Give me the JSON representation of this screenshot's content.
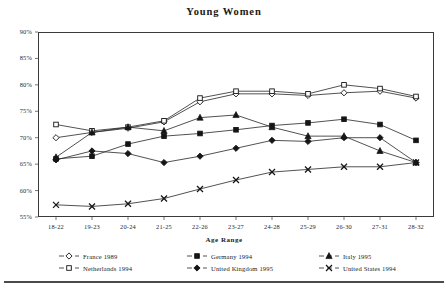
{
  "chart": {
    "title": "Young Women",
    "xlabel": "Age Range",
    "ylabel": ""
  },
  "chart_data": {
    "type": "line",
    "title": "Young Women",
    "xlabel": "Age Range",
    "ylabel": "",
    "ylim": [
      55,
      90
    ],
    "ytick_labels": [
      "90%",
      "85%",
      "80%",
      "75%",
      "70%",
      "65%",
      "60%",
      "55%"
    ],
    "yticks": [
      90,
      85,
      80,
      75,
      70,
      65,
      60,
      55
    ],
    "grid": false,
    "legend_position": "bottom",
    "categories": [
      "18-22",
      "19-23",
      "20-24",
      "21-25",
      "22-26",
      "23-27",
      "24-28",
      "25-29",
      "26-30",
      "27-31",
      "28-32"
    ],
    "series": [
      {
        "name": "France 1989",
        "marker": "open-diamond",
        "values": [
          70.0,
          71.0,
          71.8,
          73.0,
          76.8,
          78.3,
          78.3,
          78.0,
          78.5,
          78.8,
          77.5
        ]
      },
      {
        "name": "Netherlands 1994",
        "marker": "open-square",
        "values": [
          72.5,
          71.3,
          72.0,
          73.2,
          77.5,
          78.8,
          78.8,
          78.3,
          80.0,
          79.3,
          77.8
        ]
      },
      {
        "name": "Germany 1994",
        "marker": "filled-square",
        "values": [
          66.0,
          66.5,
          68.8,
          70.3,
          70.8,
          71.5,
          72.3,
          72.8,
          73.5,
          72.5,
          69.5
        ]
      },
      {
        "name": "United Kingdom 1995",
        "marker": "filled-diamond",
        "values": [
          65.8,
          67.5,
          67.0,
          65.3,
          66.5,
          68.0,
          69.5,
          69.3,
          70.0,
          70.0,
          65.3
        ]
      },
      {
        "name": "Italy 1995",
        "marker": "filled-triangle",
        "values": [
          66.3,
          71.0,
          72.0,
          71.3,
          73.8,
          74.3,
          72.0,
          70.3,
          70.3,
          67.5,
          65.3
        ]
      },
      {
        "name": "United States 1994",
        "marker": "cross-x",
        "values": [
          57.3,
          57.0,
          57.5,
          58.5,
          60.3,
          62.0,
          63.5,
          64.0,
          64.5,
          64.5,
          65.3
        ]
      }
    ]
  },
  "legend": {
    "items": [
      {
        "label": "France 1989",
        "marker": "open-diamond"
      },
      {
        "label": "Germany 1994",
        "marker": "filled-square"
      },
      {
        "label": "Italy 1995",
        "marker": "filled-triangle"
      },
      {
        "label": "Netherlands 1994",
        "marker": "open-square"
      },
      {
        "label": "United Kingdom 1995",
        "marker": "filled-diamond"
      },
      {
        "label": "United States 1994",
        "marker": "cross-x"
      }
    ]
  }
}
